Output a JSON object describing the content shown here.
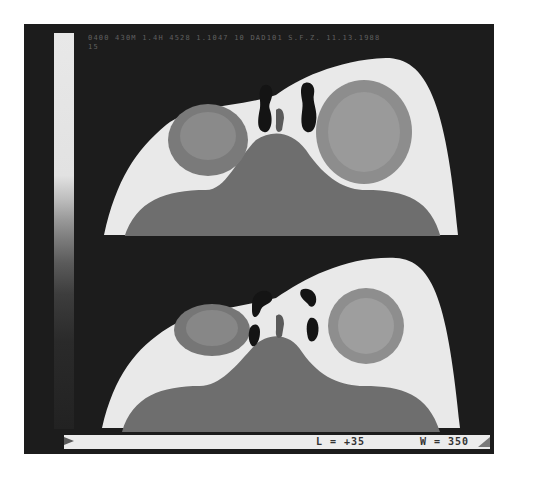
{
  "figure": {
    "header_text": "0400 430M 1.4H 4528 1.1047 10 DAD101 S.F.Z. 11.13.1988\n15",
    "slices": [
      {
        "id": "top",
        "label": "upper axial slice"
      },
      {
        "id": "bottom",
        "label": "lower axial slice"
      }
    ],
    "display_settings": {
      "level_label": "L = +35",
      "window_label": "W = 350"
    },
    "colors": {
      "background": "#1c1c1c",
      "bone": "#f2f2f2",
      "soft_tissue": "#6a6a6a",
      "air": "#141414"
    }
  }
}
